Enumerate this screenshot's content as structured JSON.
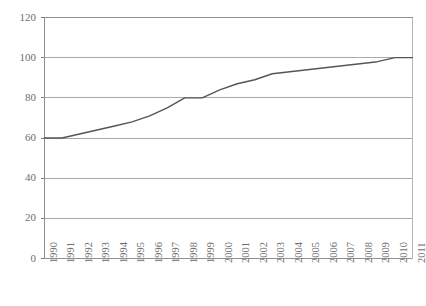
{
  "chart_data": {
    "type": "line",
    "title": "",
    "subtitle": "",
    "xlabel": "",
    "ylabel": "",
    "grid": true,
    "legend": "none",
    "xlim": [
      1990,
      2011
    ],
    "ylim": [
      0,
      120
    ],
    "yticks": [
      0,
      20,
      40,
      60,
      80,
      100,
      120
    ],
    "ytick_labels": [
      "0",
      "20",
      "40",
      "60",
      "80",
      "100",
      "120"
    ],
    "categories": [
      "1990",
      "1991",
      "1992",
      "1993",
      "1994",
      "1995",
      "1996",
      "1997",
      "1998",
      "1999",
      "2000",
      "2001",
      "2002",
      "2003",
      "2004",
      "2005",
      "2006",
      "2007",
      "2008",
      "2009",
      "2010",
      "2011"
    ],
    "x": [
      1990,
      1991,
      1992,
      1993,
      1994,
      1995,
      1996,
      1997,
      1998,
      1999,
      2000,
      2001,
      2002,
      2003,
      2004,
      2005,
      2006,
      2007,
      2008,
      2009,
      2010,
      2011
    ],
    "series": [
      {
        "name": "value",
        "values": [
          60,
          60,
          62,
          64,
          66,
          68,
          71,
          75,
          80,
          80,
          84,
          87,
          89,
          92,
          93,
          94,
          95,
          96,
          97,
          98,
          100,
          100
        ],
        "color": "#555555",
        "width": 1.4,
        "markers": "none"
      }
    ]
  },
  "axes": {
    "y_axis_name": "y-axis",
    "x_axis_name": "x-axis"
  }
}
